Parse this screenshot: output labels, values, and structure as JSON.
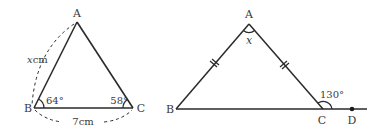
{
  "figures": [
    {
      "id": "left-triangle",
      "vertices": {
        "A": {
          "label": "A"
        },
        "B": {
          "label": "B"
        },
        "C": {
          "label": "C"
        }
      },
      "angle_B": "64°",
      "angle_C": "58°",
      "side_AB": {
        "var": "x",
        "unit": "cm"
      },
      "side_BC": "7cm"
    },
    {
      "id": "right-triangle",
      "vertices": {
        "A": {
          "label": "A"
        },
        "B": {
          "label": "B"
        },
        "C": {
          "label": "C"
        },
        "D": {
          "label": "D"
        }
      },
      "angle_A": "x",
      "exterior_angle_C": "130°",
      "equal_sides": [
        "AB",
        "AC"
      ]
    }
  ],
  "colors": {
    "line": "#2a2a2a",
    "text": "#3a3a3a"
  }
}
